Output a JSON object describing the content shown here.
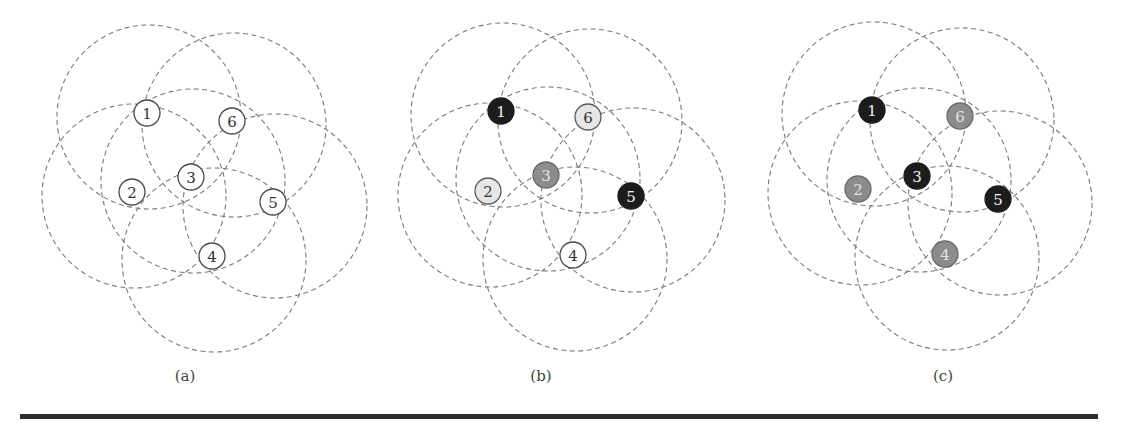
{
  "figure": {
    "range_radius": 92,
    "circle_offset": [
      2,
      4
    ],
    "node_radius": 13,
    "styles": {
      "white": {
        "fill": "#ffffff",
        "stroke": "#4a4a4a",
        "text": "#333333"
      },
      "light": {
        "fill": "#e6e6e6",
        "stroke": "#5a5a5a",
        "text": "#333333"
      },
      "gray": {
        "fill": "#8c8c8c",
        "stroke": "#6a6a6a",
        "text": "#e4e4e4"
      },
      "black": {
        "fill": "#1c1c1c",
        "stroke": "#1c1c1c",
        "text": "#f2f2f2"
      }
    },
    "panels": [
      {
        "label": "(a)",
        "label_pos": [
          185,
          377
        ],
        "nodes": [
          {
            "id": "1",
            "x": 147,
            "y": 113,
            "style": "white"
          },
          {
            "id": "2",
            "x": 132,
            "y": 192,
            "style": "white"
          },
          {
            "id": "3",
            "x": 191,
            "y": 177,
            "style": "white"
          },
          {
            "id": "4",
            "x": 212,
            "y": 256,
            "style": "white"
          },
          {
            "id": "5",
            "x": 273,
            "y": 202,
            "style": "white"
          },
          {
            "id": "6",
            "x": 232,
            "y": 121,
            "style": "white"
          }
        ]
      },
      {
        "label": "(b)",
        "label_pos": [
          541,
          377
        ],
        "nodes": [
          {
            "id": "1",
            "x": 501,
            "y": 111,
            "style": "black"
          },
          {
            "id": "2",
            "x": 488,
            "y": 191,
            "style": "light"
          },
          {
            "id": "3",
            "x": 546,
            "y": 175,
            "style": "gray"
          },
          {
            "id": "4",
            "x": 573,
            "y": 255,
            "style": "white"
          },
          {
            "id": "5",
            "x": 631,
            "y": 196,
            "style": "black"
          },
          {
            "id": "6",
            "x": 588,
            "y": 117,
            "style": "light"
          }
        ]
      },
      {
        "label": "(c)",
        "label_pos": [
          943,
          377
        ],
        "nodes": [
          {
            "id": "1",
            "x": 872,
            "y": 110,
            "style": "black"
          },
          {
            "id": "2",
            "x": 858,
            "y": 189,
            "style": "gray"
          },
          {
            "id": "3",
            "x": 917,
            "y": 176,
            "style": "black"
          },
          {
            "id": "4",
            "x": 945,
            "y": 254,
            "style": "gray"
          },
          {
            "id": "5",
            "x": 998,
            "y": 199,
            "style": "black"
          },
          {
            "id": "6",
            "x": 960,
            "y": 116,
            "style": "gray"
          }
        ]
      }
    ]
  }
}
